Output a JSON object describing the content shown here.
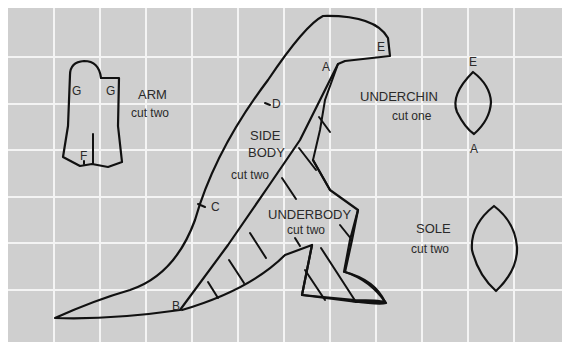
{
  "diagram": {
    "background": {
      "paper": "#ffffff",
      "field": "#cfcfcf",
      "grid": "#f4f4f4"
    },
    "grid": {
      "left": 8,
      "top": 8,
      "right": 562,
      "bottom": 342,
      "x_lines": [
        54,
        100,
        146,
        192,
        238,
        284,
        330,
        376,
        422,
        468,
        514
      ],
      "y_lines": [
        57,
        104,
        150,
        197,
        243,
        290
      ]
    },
    "pieces": [
      {
        "name": "ARM",
        "instruction": "cut two",
        "points": [
          "G",
          "G",
          "F"
        ]
      },
      {
        "name": "SIDE BODY",
        "name_line1": "SIDE",
        "name_line2": "BODY",
        "instruction": "cut two",
        "points": [
          "A",
          "B",
          "C",
          "D",
          "E"
        ]
      },
      {
        "name": "UNDERCHIN",
        "instruction": "cut one",
        "points": [
          "E",
          "A"
        ]
      },
      {
        "name": "UNDERBODY",
        "instruction": "cut two",
        "points": []
      },
      {
        "name": "SOLE",
        "instruction": "cut two",
        "points": []
      }
    ],
    "marks": {
      "A": "A",
      "B": "B",
      "C": "C",
      "D": "D",
      "E": "E",
      "F": "F",
      "G": "G"
    }
  }
}
